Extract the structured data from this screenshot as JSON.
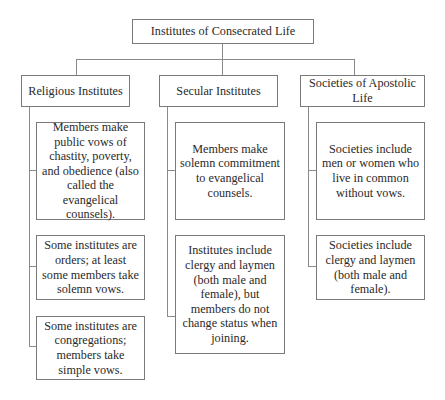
{
  "root": {
    "label": "Institutes of Consecrated Life"
  },
  "branches": [
    {
      "label": "Religious Institutes",
      "children": [
        "Members make public vows of chastity, poverty, and obedience (also called the evangelical counsels).",
        "Some institutes are orders; at least some members take solemn vows.",
        "Some institutes are congregations; members take simple vows."
      ]
    },
    {
      "label": "Secular Institutes",
      "children": [
        "Members make solemn commitment to evangelical counsels.",
        "Institutes include clergy and laymen (both male and female), but members do not change status when joining."
      ]
    },
    {
      "label": "Societies of Apostolic Life",
      "children": [
        "Societies include men or women who live in common without vows.",
        "Societies include clergy and laymen (both male and female)."
      ]
    }
  ]
}
